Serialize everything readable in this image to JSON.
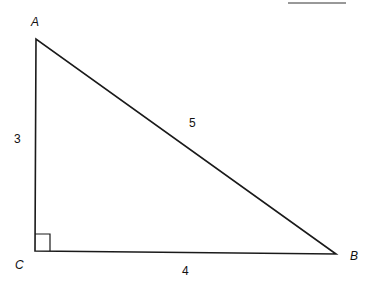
{
  "diagram": {
    "type": "right-triangle",
    "vertices": {
      "A": {
        "label": "A",
        "x": 36,
        "y": 39
      },
      "B": {
        "label": "B",
        "x": 336,
        "y": 254
      },
      "C": {
        "label": "C",
        "x": 35,
        "y": 251
      }
    },
    "sides": {
      "AC": {
        "label": "3"
      },
      "CB": {
        "label": "4"
      },
      "AB": {
        "label": "5"
      }
    },
    "right_angle_at": "C",
    "stroke_color": "#1a1a1a"
  }
}
